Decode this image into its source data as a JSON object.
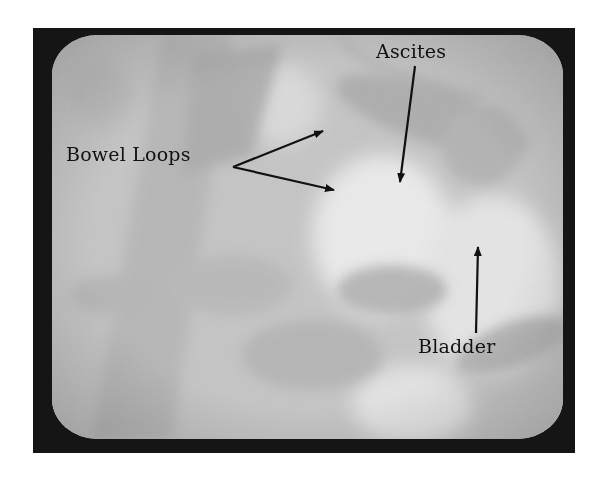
{
  "image": {
    "description": "Ultrasound scan displayed on a CRT monitor with annotations",
    "colors": {
      "frame": "#151515",
      "screen_base": "#c9c9c9",
      "bright_region": "#ececec",
      "dark_region": "#a6a6a6",
      "annotation": "#111111"
    }
  },
  "annotations": {
    "bowel_loops": {
      "label": "Bowel Loops",
      "arrows": 2
    },
    "ascites": {
      "label": "Ascites",
      "arrows": 1
    },
    "bladder": {
      "label": "Bladder",
      "arrows": 1
    }
  }
}
